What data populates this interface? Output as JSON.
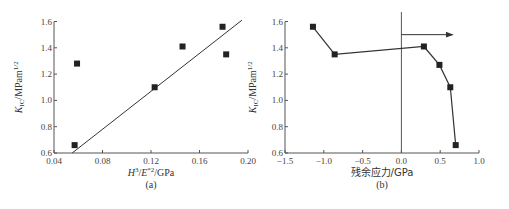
{
  "chart_data": [
    {
      "panel": "a",
      "type": "scatter",
      "caption": "(a)",
      "xlabel": "H³/E*²/GPa",
      "ylabel": "K_IC/MPam^1/2",
      "xlim": [
        0.04,
        0.2
      ],
      "ylim": [
        0.6,
        1.6
      ],
      "xticks": [
        "0.04",
        "0.08",
        "0.12",
        "0.16",
        "0.20"
      ],
      "yticks": [
        "0.6",
        "0.8",
        "1.0",
        "1.2",
        "1.4",
        "1.6"
      ],
      "points": [
        {
          "x": 0.057,
          "y": 0.66
        },
        {
          "x": 0.059,
          "y": 1.28
        },
        {
          "x": 0.123,
          "y": 1.1
        },
        {
          "x": 0.146,
          "y": 1.41
        },
        {
          "x": 0.179,
          "y": 1.56
        },
        {
          "x": 0.182,
          "y": 1.35
        }
      ],
      "fit_line": [
        {
          "x": 0.055,
          "y": 0.6
        },
        {
          "x": 0.195,
          "y": 1.61
        }
      ],
      "grid": false
    },
    {
      "panel": "b",
      "type": "line",
      "caption": "(b)",
      "xlabel": "残余应力/GPa",
      "ylabel": "K_IC/MPam^1/2",
      "xlim": [
        -1.5,
        1.0
      ],
      "ylim": [
        0.6,
        1.6
      ],
      "xticks": [
        "-1.5",
        "-1.0",
        "-0.5",
        "0.0",
        "0.5",
        "1.0"
      ],
      "yticks": [
        "0.6",
        "0.8",
        "1.0",
        "1.2",
        "1.4",
        "1.6"
      ],
      "points": [
        {
          "x": -1.14,
          "y": 1.56
        },
        {
          "x": -0.86,
          "y": 1.35
        },
        {
          "x": 0.29,
          "y": 1.41
        },
        {
          "x": 0.49,
          "y": 1.27
        },
        {
          "x": 0.63,
          "y": 1.1
        },
        {
          "x": 0.7,
          "y": 0.66
        }
      ],
      "annotations": [
        {
          "type": "vertical_line",
          "x": 0.0
        },
        {
          "type": "arrow",
          "from": {
            "x": 0.0,
            "y": 1.5
          },
          "to": {
            "x": 0.66,
            "y": 1.5
          }
        }
      ],
      "grid": false
    }
  ]
}
